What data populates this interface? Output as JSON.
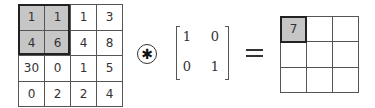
{
  "input_matrix": {
    "rows": [
      [
        "1",
        "1",
        "1",
        "3"
      ],
      [
        "4",
        "6",
        "4",
        "8"
      ],
      [
        "30",
        "0",
        "1",
        "5"
      ],
      [
        "0",
        "2",
        "2",
        "4"
      ]
    ],
    "highlighted_window": {
      "row_start": 0,
      "col_start": 0,
      "size": 2
    },
    "highlight_color": "#c6c6c6"
  },
  "operator": {
    "symbol": "✱",
    "name": "convolution"
  },
  "kernel": {
    "rows": [
      [
        "1",
        "0"
      ],
      [
        "0",
        "1"
      ]
    ]
  },
  "equals": "=",
  "output_matrix": {
    "rows": [
      [
        "7",
        "",
        ""
      ],
      [
        "",
        "",
        ""
      ],
      [
        "",
        "",
        ""
      ]
    ],
    "highlighted_cell": {
      "row": 0,
      "col": 0
    }
  }
}
